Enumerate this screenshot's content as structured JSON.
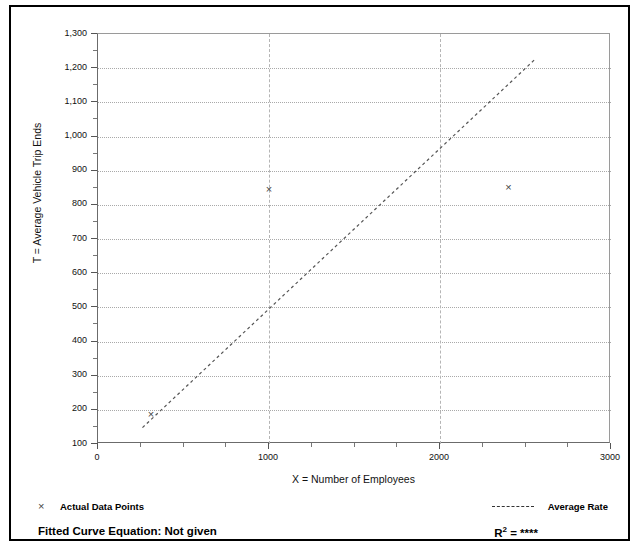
{
  "chart_data": {
    "type": "scatter",
    "title": "",
    "xlabel": "X = Number of Employees",
    "ylabel": "T = Average Vehicle Trip Ends",
    "xlim": [
      0,
      3000
    ],
    "ylim": [
      100,
      1300
    ],
    "x_ticks": [
      "0",
      "1000",
      "2000",
      "3000"
    ],
    "x_tick_values": [
      0,
      1000,
      2000,
      3000
    ],
    "x_minor_step": 250,
    "y_ticks": [
      "100",
      "200",
      "300",
      "400",
      "500",
      "600",
      "700",
      "800",
      "900",
      "1,000",
      "1,100",
      "1,200",
      "1,300"
    ],
    "y_tick_values": [
      100,
      200,
      300,
      400,
      500,
      600,
      700,
      800,
      900,
      1000,
      1100,
      1200,
      1300
    ],
    "y_minor_step": 50,
    "grid": true,
    "legend_position": "bottom",
    "series": [
      {
        "name": "Actual Data Points",
        "marker": "x",
        "points": [
          {
            "x": 310,
            "y": 185
          },
          {
            "x": 1000,
            "y": 845
          },
          {
            "x": 2400,
            "y": 850
          }
        ]
      },
      {
        "name": "Average Rate",
        "type": "line",
        "style": "dashed",
        "endpoints": [
          {
            "x": 260,
            "y": 148
          },
          {
            "x": 2560,
            "y": 1228
          }
        ]
      }
    ]
  },
  "axes": {
    "x_title": "X = Number of Employees",
    "y_title": "T = Average Vehicle Trip Ends"
  },
  "legend": {
    "data_points_marker": "×",
    "data_points_label": "Actual Data Points",
    "average_rate_label": "Average Rate",
    "fitted_curve_label": "Fitted Curve Equation:  Not given",
    "r_squared_prefix": "R",
    "r_squared_exponent": "2",
    "r_squared_value": "= ****"
  },
  "colors": {
    "grid": "#a9a9a9",
    "axis": "#555555",
    "marker": "#444444",
    "trendline": "#555555",
    "frame": "#000000",
    "background": "#ffffff"
  }
}
